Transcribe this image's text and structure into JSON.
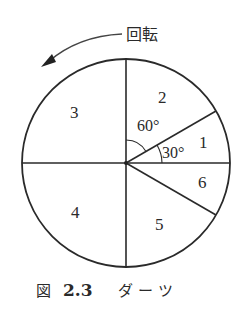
{
  "diagram": {
    "type": "dartboard",
    "rotation_label": "回転",
    "rotation_direction": "counterclockwise",
    "sectors": [
      {
        "label": "1",
        "angle_deg": 30,
        "from_deg": 0,
        "to_deg": 30
      },
      {
        "label": "2",
        "angle_deg": 60,
        "from_deg": 30,
        "to_deg": 90
      },
      {
        "label": "3",
        "angle_deg": 90,
        "from_deg": 90,
        "to_deg": 180
      },
      {
        "label": "4",
        "angle_deg": 90,
        "from_deg": 180,
        "to_deg": 270
      },
      {
        "label": "5",
        "angle_deg": 60,
        "from_deg": 270,
        "to_deg": 330
      },
      {
        "label": "6",
        "angle_deg": 30,
        "from_deg": 330,
        "to_deg": 360
      }
    ],
    "angle_annotations": {
      "a60": "60°",
      "a30": "30°"
    },
    "line_color": "#2a2a2a"
  },
  "caption": {
    "prefix": "図",
    "number": "2.3",
    "title": "ダ ー ツ"
  }
}
